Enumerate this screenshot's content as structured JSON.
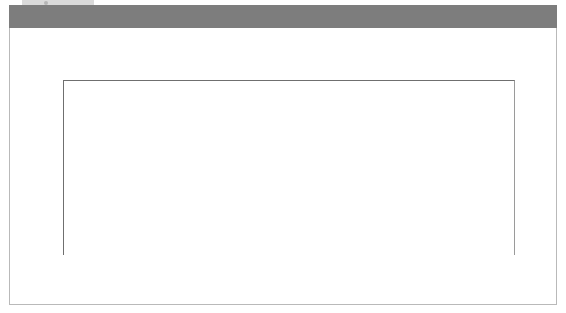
{
  "figure": {
    "axis_note": "Billions of dollars",
    "title_bar_color": "#7d7d7d",
    "panel_color": "#ffffff"
  },
  "colors": {
    "world_total_band": "#8a8a8a",
    "developed_band": "#e2e2e2",
    "southeast_cis_band": "#111111",
    "gridline": "#bdbdbd",
    "axis": "#6f6f6f",
    "text": "#3a3a3a"
  },
  "annotations": [
    {
      "id": "world-total",
      "label": "World total"
    },
    {
      "id": "developing-economies",
      "label": "Developing economies"
    },
    {
      "id": "developed-economies",
      "label": "Developed economies"
    },
    {
      "id": "southeast-europe-cis",
      "label": "Southeast Europe and CIS"
    }
  ],
  "chart_data": {
    "type": "area",
    "stacked": true,
    "xlabel": "",
    "ylabel": "Billions of dollars",
    "ylim": [
      0,
      1400
    ],
    "yticks": [
      0,
      200,
      400,
      600,
      800,
      1000,
      1200,
      1400
    ],
    "ytick_labels": [
      "0",
      "200",
      "400",
      "600",
      "800",
      "1,000",
      "1,200",
      "1,400"
    ],
    "grid": true,
    "legend": "annotations-with-leader-lines",
    "categories": [
      "1980",
      "1981",
      "1982",
      "1983",
      "1984",
      "1985",
      "1986",
      "1987",
      "1988",
      "1989",
      "1990",
      "1991",
      "1992",
      "1993",
      "1994",
      "1995",
      "1996",
      "1997",
      "1998",
      "1999",
      "2000",
      "2001",
      "2002",
      "2003",
      "2004",
      "2005"
    ],
    "series": [
      {
        "name": "Southeast Europe and CIS",
        "order": 1,
        "color": "#111111",
        "values": [
          0,
          0,
          0,
          0,
          0,
          0,
          0,
          0,
          0,
          0,
          1,
          2,
          4,
          6,
          6,
          5,
          6,
          9,
          7,
          9,
          7,
          10,
          11,
          20,
          30,
          40
        ]
      },
      {
        "name": "Developed economies",
        "order": 2,
        "color": "#e2e2e2",
        "values": [
          47,
          40,
          30,
          30,
          36,
          44,
          67,
          110,
          133,
          166,
          172,
          117,
          113,
          135,
          145,
          205,
          220,
          272,
          484,
          838,
          1134,
          601,
          442,
          361,
          418,
          542
        ]
      },
      {
        "name": "Developing economies",
        "order": 3,
        "color": "#8a8a8a",
        "values": [
          8,
          17,
          20,
          18,
          18,
          15,
          18,
          25,
          31,
          29,
          35,
          41,
          51,
          74,
          102,
          114,
          153,
          193,
          191,
          232,
          257,
          220,
          164,
          175,
          283,
          334
        ]
      }
    ],
    "totals": {
      "name": "World total",
      "values": [
        55,
        57,
        50,
        48,
        54,
        59,
        85,
        135,
        164,
        195,
        208,
        160,
        168,
        215,
        253,
        324,
        379,
        474,
        682,
        1079,
        1398,
        831,
        617,
        556,
        731,
        916
      ]
    },
    "notes": [
      "World total is the sum of the three stacked bands.",
      "Peak of world total is ~1,400 billion dollars in 2000.",
      "Trough after the peak is ~560 billion dollars in 2003."
    ]
  }
}
